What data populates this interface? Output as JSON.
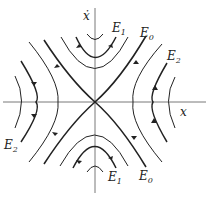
{
  "figure": {
    "type": "phase portrait",
    "axes": {
      "x_label": "x",
      "y_label": "ẋ"
    },
    "energy_labels": [
      {
        "id": "E1_top",
        "text": "E",
        "sub": "1"
      },
      {
        "id": "E0_top",
        "text": "E",
        "sub": "0"
      },
      {
        "id": "E2_right",
        "text": "E",
        "sub": "2"
      },
      {
        "id": "E2_left",
        "text": "E",
        "sub": "2"
      },
      {
        "id": "E1_bottom",
        "text": "E",
        "sub": "1"
      },
      {
        "id": "E0_bottom",
        "text": "E",
        "sub": "0"
      }
    ],
    "colors": {
      "line": "#222222",
      "axis": "#555555",
      "background": "#ffffff"
    }
  }
}
